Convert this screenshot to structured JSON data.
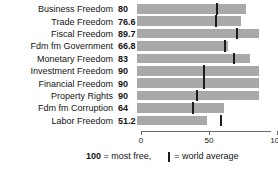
{
  "chart_data": {
    "type": "bar",
    "orientation": "horizontal",
    "title": "",
    "xlabel": "",
    "ylabel": "",
    "xlim": [
      0,
      100
    ],
    "grid": false,
    "legend_position": "bottom",
    "categories": [
      "Business Freedom",
      "Trade Freedom",
      "Fiscal Freedom",
      "Fdm fm Government",
      "Monetary Freedom",
      "Investment Freedom",
      "Financial Freedom",
      "Property Rights",
      "Fdm fm Corruption",
      "Labor Freedom"
    ],
    "values": [
      80,
      76.6,
      89.7,
      66.8,
      83,
      90,
      90,
      90,
      64,
      51.2
    ],
    "value_labels": [
      "80",
      "76.6",
      "89.7",
      "66.8",
      "83",
      "90",
      "90",
      "90",
      "64",
      "51.2"
    ],
    "series": [
      {
        "name": "Country score",
        "values": [
          80,
          76.6,
          89.7,
          66.8,
          83,
          90,
          90,
          90,
          64,
          51.2
        ]
      },
      {
        "name": "World average",
        "type": "marker",
        "values": [
          59.0,
          58.0,
          73.5,
          65.0,
          71.5,
          49.0,
          49.5,
          44.0,
          41.0,
          62.0
        ]
      }
    ],
    "ticks": [
      {
        "value": 0,
        "label": "0"
      },
      {
        "value": 50,
        "label": "50"
      },
      {
        "value": 100,
        "label": "100"
      }
    ],
    "colors": {
      "bar": "#a9a9a9",
      "marker": "#1c1c1c",
      "axis": "#6b6b6b",
      "text": "#141414",
      "background": "#ffffff"
    }
  },
  "footer": {
    "most_free_number": "100",
    "most_free_text": " = most free,",
    "legend_text": "= world average"
  }
}
